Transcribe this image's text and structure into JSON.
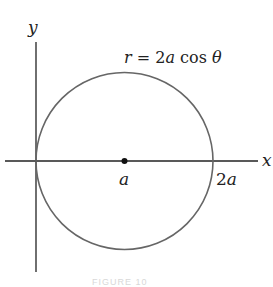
{
  "figure": {
    "equation_label": "r = 2a cos θ",
    "equation_parts": {
      "r": "r",
      "eq": " = 2",
      "a": "a",
      "cos": " cos ",
      "theta": "θ"
    },
    "axes": {
      "x_label": "x",
      "y_label": "y"
    },
    "ticks": {
      "center_label": "a",
      "right_label_num": "2",
      "right_label_var": "a"
    },
    "caption": "FIGURE 10",
    "colors": {
      "curve": "#666666",
      "axes": "#222222",
      "point": "#111111"
    }
  }
}
